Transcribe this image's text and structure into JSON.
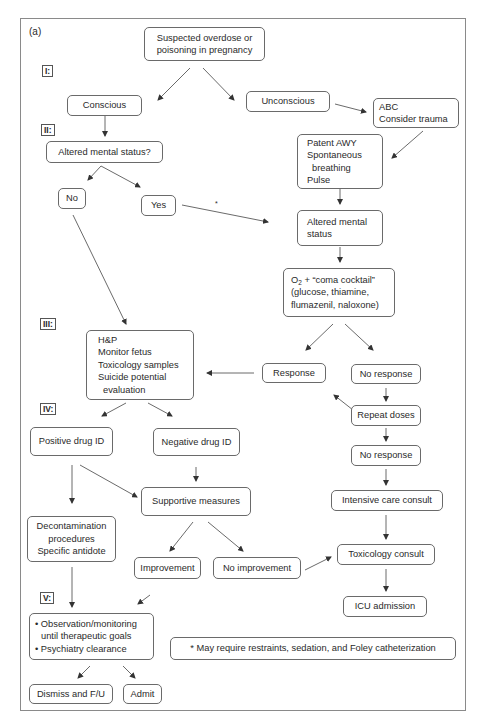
{
  "panel_label": "(a)",
  "stages": [
    "I:",
    "II:",
    "III:",
    "IV:",
    "V:"
  ],
  "asterisk": "*",
  "nodes": {
    "start": [
      "Suspected overdose or",
      "poisoning in pregnancy"
    ],
    "conscious": "Conscious",
    "unconscious": "Unconscious",
    "abc": [
      "ABC",
      "Consider trauma"
    ],
    "altered_q": "Altered mental status?",
    "patent": [
      "Patent AWY",
      "Spontaneous",
      "breathing",
      "Pulse"
    ],
    "no": "No",
    "yes": "Yes",
    "altered": [
      "Altered mental",
      "status"
    ],
    "o2": {
      "o": "O",
      "sub": "2",
      "rest": " + “coma cocktail”",
      "line2": "(glucose, thiamine,",
      "line3": "flumazenil, naloxone)"
    },
    "hp": [
      "H&P",
      "Monitor fetus",
      "Toxicology samples",
      "Suicide potential",
      "evaluation"
    ],
    "response": "Response",
    "no_response_1": "No response",
    "repeat_doses": "Repeat doses",
    "no_response_2": "No response",
    "positive_id": "Positive drug ID",
    "negative_id": "Negative drug ID",
    "supportive": "Supportive measures",
    "intensive": "Intensive care consult",
    "decon": [
      "Decontamination",
      "procedures",
      "Specific antidote"
    ],
    "improvement": "Improvement",
    "no_improvement": "No improvement",
    "toxicology": "Toxicology consult",
    "icu": "ICU admission",
    "observation": [
      "• Observation/monitoring",
      "until therapeutic goals",
      "• Psychiatry clearance"
    ],
    "dismiss": "Dismiss and F/U",
    "admit": "Admit",
    "footnote": "* May require restraints, sedation, and Foley catheterization"
  },
  "colors": {
    "border": "#6a6a6a",
    "frame": "#8a8a8a",
    "arrow": "#333333",
    "text": "#2a2a2a"
  }
}
